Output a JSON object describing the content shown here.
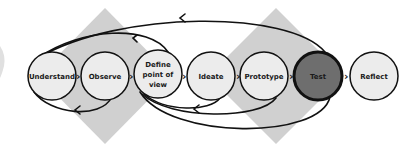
{
  "diagram": {
    "type": "design-thinking-process",
    "colors": {
      "background": "#ffffff",
      "diamond": "#d0d0d0",
      "node_fill": "#ececec",
      "node_stroke": "#111111",
      "highlight_fill": "#6e6e6e",
      "arrow": "#111111"
    },
    "stages": [
      {
        "id": "understand",
        "label": "Understand",
        "cx": 52,
        "cy": 76,
        "highlighted": false
      },
      {
        "id": "observe",
        "label": "Observe",
        "cx": 105,
        "cy": 76,
        "highlighted": false
      },
      {
        "id": "define",
        "label_lines": [
          "Define",
          "point of",
          "view"
        ],
        "cx": 158,
        "cy": 74,
        "highlighted": false
      },
      {
        "id": "ideate",
        "label": "Ideate",
        "cx": 211,
        "cy": 76,
        "highlighted": false
      },
      {
        "id": "prototype",
        "label": "Prototype",
        "cx": 264,
        "cy": 76,
        "highlighted": false
      },
      {
        "id": "test",
        "label": "Test",
        "cx": 318,
        "cy": 76,
        "highlighted": true
      },
      {
        "id": "reflect",
        "label": "Reflect",
        "cx": 374,
        "cy": 76,
        "highlighted": false
      }
    ],
    "connectors": [
      "›",
      "›",
      "›",
      "›",
      "›",
      "›"
    ],
    "feedback_loops": [
      {
        "from": "test",
        "to": "understand",
        "side": "top"
      },
      {
        "from": "define",
        "to": "understand",
        "side": "top"
      },
      {
        "from": "observe",
        "to": "understand",
        "side": "bottom"
      },
      {
        "from": "prototype",
        "to": "define",
        "side": "bottom"
      },
      {
        "from": "test",
        "to": "define",
        "side": "bottom"
      },
      {
        "from": "ideate",
        "to": "define",
        "side": "bottom"
      }
    ]
  }
}
